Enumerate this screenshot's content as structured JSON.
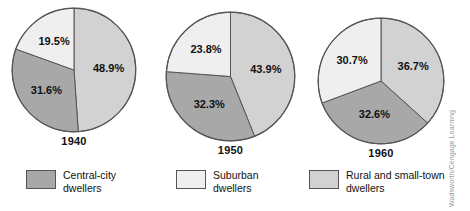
{
  "chart_data": {
    "type": "pie",
    "title": "",
    "legend_position": "bottom",
    "categories": [
      "Central-city dwellers",
      "Suburban dwellers",
      "Rural and small-town dwellers"
    ],
    "colors": {
      "central_city": "#a8a8a8",
      "suburban": "#efefef",
      "rural": "#d2d2d2",
      "outline": "#555555"
    },
    "charts": [
      {
        "label": "1940",
        "slices": [
          {
            "name": "Rural and small-town dwellers",
            "value": 48.9,
            "display": "48.9%",
            "color_key": "rural"
          },
          {
            "name": "Central-city dwellers",
            "value": 31.6,
            "display": "31.6%",
            "color_key": "central_city"
          },
          {
            "name": "Suburban dwellers",
            "value": 19.5,
            "display": "19.5%",
            "color_key": "suburban"
          }
        ]
      },
      {
        "label": "1950",
        "slices": [
          {
            "name": "Rural and small-town dwellers",
            "value": 43.9,
            "display": "43.9%",
            "color_key": "rural"
          },
          {
            "name": "Central-city dwellers",
            "value": 32.3,
            "display": "32.3%",
            "color_key": "central_city"
          },
          {
            "name": "Suburban dwellers",
            "value": 23.8,
            "display": "23.8%",
            "color_key": "suburban"
          }
        ]
      },
      {
        "label": "1960",
        "slices": [
          {
            "name": "Rural and small-town dwellers",
            "value": 36.7,
            "display": "36.7%",
            "color_key": "rural"
          },
          {
            "name": "Central-city dwellers",
            "value": 32.6,
            "display": "32.6%",
            "color_key": "central_city"
          },
          {
            "name": "Suburban dwellers",
            "value": 30.7,
            "display": "30.7%",
            "color_key": "suburban"
          }
        ]
      }
    ]
  },
  "legend": {
    "items": [
      {
        "label": "Central-city\ndwellers",
        "color_key": "central_city"
      },
      {
        "label": "Suburban\ndwellers",
        "color_key": "suburban"
      },
      {
        "label": "Rural and small-town\ndwellers",
        "color_key": "rural"
      }
    ]
  },
  "credit": {
    "text": "Wadsworth/Cengage Learning"
  }
}
